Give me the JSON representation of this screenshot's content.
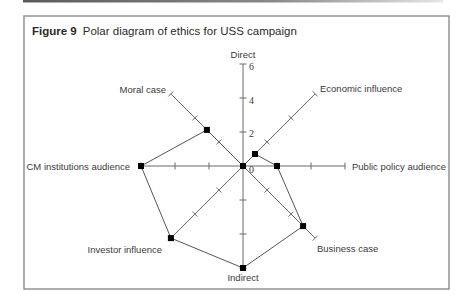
{
  "figure": {
    "label": "Figure 9",
    "title": "Polar diagram of ethics for USS campaign"
  },
  "chart_data": {
    "type": "line",
    "coordinate_system": "polar",
    "axes": [
      "Direct",
      "Economic influence",
      "Public policy audience",
      "Business case",
      "Indirect",
      "Investor influence",
      "CM institutions audience",
      "Moral case"
    ],
    "values": [
      0,
      1,
      2,
      5,
      6,
      6,
      6,
      3
    ],
    "range": [
      0,
      6
    ],
    "ticks": [
      0,
      2,
      4,
      6
    ],
    "tick_labels": [
      "0",
      "2",
      "4",
      "6"
    ],
    "grid": false,
    "legend": "none"
  }
}
